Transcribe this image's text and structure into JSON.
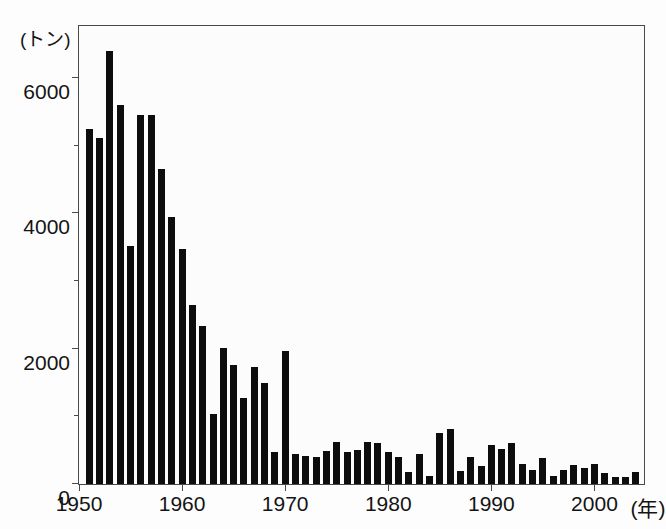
{
  "chart_data": {
    "type": "bar",
    "title": "",
    "subtitle": "",
    "xlabel": "(年)",
    "ylabel": "(トン)",
    "y_unit_label": "(トン)",
    "x_unit_label": "(年)",
    "xlim": [
      1950,
      2005
    ],
    "ylim": [
      0,
      6800
    ],
    "grid": false,
    "legend": null,
    "y_ticks_major": [
      0,
      2000,
      4000,
      6000
    ],
    "y_tick_labels": [
      "0",
      "2000",
      "4000",
      "6000"
    ],
    "y_ticks_minor": [
      1000,
      3000,
      5000
    ],
    "x_ticks_major": [
      1950,
      1960,
      1970,
      1980,
      1990,
      2000
    ],
    "x_tick_labels": [
      "1950",
      "1960",
      "1970",
      "1980",
      "1990",
      "2000"
    ],
    "bar_color": "#0d0d0d",
    "categories": [
      1951,
      1952,
      1953,
      1954,
      1955,
      1956,
      1957,
      1958,
      1959,
      1960,
      1961,
      1962,
      1963,
      1964,
      1965,
      1966,
      1967,
      1968,
      1969,
      1970,
      1971,
      1972,
      1973,
      1974,
      1975,
      1976,
      1977,
      1978,
      1979,
      1980,
      1981,
      1982,
      1983,
      1984,
      1985,
      1986,
      1987,
      1988,
      1989,
      1990,
      1991,
      1992,
      1993,
      1994,
      1995,
      1996,
      1997,
      1998,
      1999,
      2000,
      2001,
      2002,
      2003,
      2004
    ],
    "values": [
      5250,
      5120,
      6400,
      5610,
      3520,
      5450,
      5450,
      4660,
      3950,
      3480,
      2650,
      2340,
      1040,
      2010,
      1760,
      1270,
      1730,
      1500,
      470,
      1960,
      450,
      420,
      400,
      490,
      620,
      470,
      500,
      620,
      610,
      480,
      400,
      180,
      440,
      120,
      750,
      810,
      190,
      400,
      260,
      580,
      520,
      610,
      300,
      200,
      390,
      120,
      200,
      280,
      240,
      300,
      160,
      100,
      110,
      180
    ]
  }
}
